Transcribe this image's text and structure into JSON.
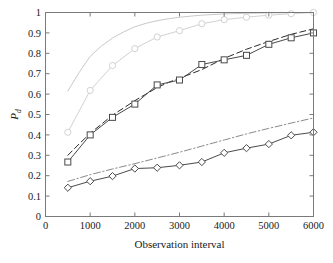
{
  "figure": {
    "background_color": "#ffffff",
    "axis_color": "#7a7a7a",
    "text_color": "#1a1a1a"
  },
  "chart_data": {
    "type": "line",
    "title": "",
    "xlabel": "Observation interval",
    "ylabel": "P_d",
    "ylabel_base": "P",
    "ylabel_sub": "d",
    "xlim": [
      0,
      6000
    ],
    "ylim": [
      0,
      1
    ],
    "xticks": [
      0,
      1000,
      2000,
      3000,
      4000,
      5000,
      6000
    ],
    "xticklabels": [
      "0",
      "1000",
      "2000",
      "3000",
      "4000",
      "5000",
      "6000"
    ],
    "yticks": [
      0,
      0.1,
      0.2,
      0.3,
      0.4,
      0.5,
      0.6,
      0.7,
      0.8,
      0.9,
      1
    ],
    "yticklabels": [
      "0",
      "0.1",
      "0.2",
      "0.3",
      "0.4",
      "0.5",
      "0.6",
      "0.7",
      "0.8",
      "0.9",
      "1"
    ],
    "grid": false,
    "legend": "none",
    "legend_position": "none",
    "series": [
      {
        "name": "light-solid-no-marker",
        "color": "#c9c9c9",
        "style": "solid",
        "marker": "none",
        "linewidth": 1.0,
        "x": [
          500,
          750,
          1000,
          1250,
          1500,
          1750,
          2000,
          2250,
          2500,
          2750,
          3000,
          3500,
          4000,
          4500,
          5000,
          5500,
          6000
        ],
        "values": [
          0.615,
          0.705,
          0.785,
          0.835,
          0.875,
          0.905,
          0.93,
          0.947,
          0.96,
          0.969,
          0.977,
          0.987,
          0.993,
          0.996,
          0.998,
          0.999,
          1.0
        ]
      },
      {
        "name": "light-solid-circle-marker",
        "color": "#d2d2d2",
        "style": "solid",
        "marker": "circle",
        "linewidth": 1.0,
        "x": [
          500,
          1000,
          1500,
          2000,
          2500,
          3000,
          3500,
          4000,
          4500,
          5000,
          5500,
          6000
        ],
        "values": [
          0.413,
          0.618,
          0.74,
          0.823,
          0.88,
          0.911,
          0.945,
          0.965,
          0.977,
          0.987,
          0.994,
          1.0
        ]
      },
      {
        "name": "black-dashed-no-marker",
        "color": "#2b2b2b",
        "style": "dashed",
        "marker": "none",
        "linewidth": 1.0,
        "x": [
          500,
          750,
          1000,
          1250,
          1500,
          1750,
          2000,
          2250,
          2500,
          2750,
          3000,
          3500,
          4000,
          4500,
          5000,
          5500,
          6000
        ],
        "values": [
          0.3,
          0.355,
          0.408,
          0.452,
          0.497,
          0.532,
          0.568,
          0.6,
          0.632,
          0.657,
          0.678,
          0.72,
          0.775,
          0.82,
          0.858,
          0.893,
          0.92
        ]
      },
      {
        "name": "dark-solid-square-marker",
        "color": "#4a4a4a",
        "style": "solid",
        "marker": "square",
        "linewidth": 1.0,
        "x": [
          500,
          1000,
          1500,
          2000,
          2500,
          3000,
          3500,
          4000,
          4500,
          5000,
          5500,
          6000
        ],
        "values": [
          0.267,
          0.4,
          0.486,
          0.551,
          0.645,
          0.669,
          0.745,
          0.768,
          0.79,
          0.844,
          0.876,
          0.9
        ]
      },
      {
        "name": "gray-dashdot-no-marker",
        "color": "#8a8a8a",
        "style": "dashdot",
        "marker": "none",
        "linewidth": 1.0,
        "x": [
          500,
          1000,
          1500,
          2000,
          2500,
          3000,
          3500,
          4000,
          4500,
          5000,
          5500,
          6000
        ],
        "values": [
          0.172,
          0.205,
          0.233,
          0.259,
          0.287,
          0.315,
          0.345,
          0.375,
          0.405,
          0.432,
          0.458,
          0.483
        ]
      },
      {
        "name": "dark-solid-diamond-marker",
        "color": "#4a4a4a",
        "style": "solid",
        "marker": "diamond",
        "linewidth": 1.0,
        "x": [
          500,
          1000,
          1500,
          2000,
          2500,
          3000,
          3500,
          4000,
          4500,
          5000,
          5500,
          6000
        ],
        "values": [
          0.141,
          0.173,
          0.198,
          0.235,
          0.239,
          0.251,
          0.267,
          0.312,
          0.335,
          0.355,
          0.398,
          0.413
        ]
      }
    ]
  }
}
